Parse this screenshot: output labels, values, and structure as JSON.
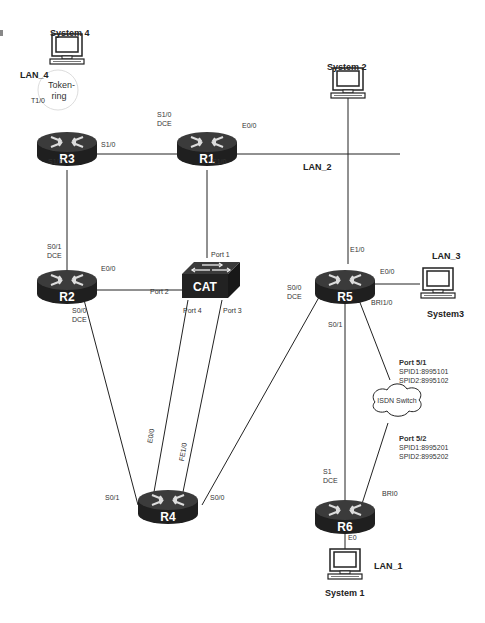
{
  "colors": {
    "router_top": "#3a3a3a",
    "router_side": "#1e1e1e",
    "line": "#222222",
    "background": "#ffffff"
  },
  "routers": [
    {
      "id": "R1",
      "label": "R1"
    },
    {
      "id": "R2",
      "label": "R2"
    },
    {
      "id": "R3",
      "label": "R3"
    },
    {
      "id": "R4",
      "label": "R4"
    },
    {
      "id": "R5",
      "label": "R5"
    },
    {
      "id": "R6",
      "label": "R6"
    }
  ],
  "switch": {
    "label": "CAT"
  },
  "isdn": {
    "label": "ISDN Switch"
  },
  "token_ring": {
    "label_line1": "Token-",
    "label_line2": "ring"
  },
  "systems": {
    "system1": "System 1",
    "system2": "System 2",
    "system3": "System3",
    "system4": "System 4"
  },
  "lans": {
    "lan1": "LAN_1",
    "lan2": "LAN_2",
    "lan3": "LAN_3",
    "lan4": "LAN_4"
  },
  "interfaces": {
    "r3_t10": "T1/0",
    "r3_s10": "S1/0",
    "r3_s11": "S1/1",
    "r1_s10": "S1/0",
    "r1_s10_dce": "DCE",
    "r1_e00": "E0/0",
    "r1_e10": "E1/0",
    "r2_s01": "S0/1",
    "r2_s01_dce": "DCE",
    "r2_e00": "E0/0",
    "r2_s00": "S0/0",
    "r2_s00_dce": "DCE",
    "cat_port1": "Port 1",
    "cat_port2": "Port 2",
    "cat_port3": "Port 3",
    "cat_port4": "Port 4",
    "r4_e00": "E0/0",
    "r4_fe10": "FE1/0",
    "r4_s01": "S0/1",
    "r4_s00": "S0/0",
    "r5_e10": "E1/0",
    "r5_e00": "E0/0",
    "r5_s00": "S0/0",
    "r5_s00_dce": "DCE",
    "r5_bri10": "BRI1/0",
    "r5_s01": "S0/1",
    "r6_s1": "S1",
    "r6_s1_dce": "DCE",
    "r6_bri0": "BRI0",
    "r6_e0": "E0"
  },
  "isdn_ports": {
    "port51": {
      "name": "Port 5/1",
      "spid1": "SPID1:8995101",
      "spid2": "SPID2:8995102"
    },
    "port52": {
      "name": "Port 5/2",
      "spid1": "SPID1:8995201",
      "spid2": "SPID2:8995202"
    }
  }
}
